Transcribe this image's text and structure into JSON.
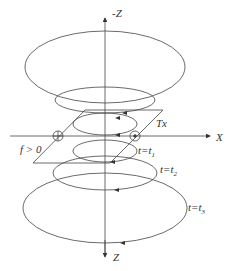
{
  "diagram": {
    "type": "tem-smoke-ring-diagram",
    "axes": {
      "top_label": "-Z",
      "bottom_label": "Z",
      "x_label": "X"
    },
    "loop_label": "Tx",
    "field_label": "f > 0",
    "time_labels": [
      {
        "var": "t",
        "eq": "=",
        "sym": "t",
        "sub": "1"
      },
      {
        "var": "t",
        "eq": "=",
        "sym": "t",
        "sub": "2"
      },
      {
        "var": "t",
        "eq": "=",
        "sym": "t",
        "sub": "3"
      }
    ],
    "markers": {
      "left": "circled-plus",
      "right": "circled-dot"
    },
    "colors": {
      "line": "#333333",
      "background": "#ffffff"
    }
  }
}
